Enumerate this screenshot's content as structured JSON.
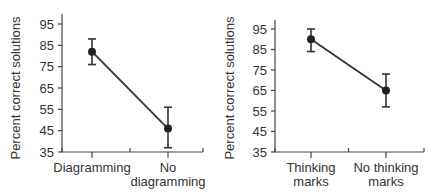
{
  "chart_data": [
    {
      "type": "line",
      "title": "",
      "xlabel": "",
      "ylabel": "Percent correct solutions",
      "ylim": [
        35,
        95
      ],
      "yticks": [
        35,
        45,
        55,
        65,
        75,
        85,
        95
      ],
      "categories": [
        "Diagramming",
        "No diagramming"
      ],
      "category_lines": [
        [
          "Diagramming"
        ],
        [
          "No",
          "diagramming"
        ]
      ],
      "series": [
        {
          "name": "Mean",
          "values": [
            82,
            46
          ],
          "error_low": [
            76,
            37
          ],
          "error_high": [
            88,
            56
          ]
        }
      ],
      "grid": false,
      "legend": null
    },
    {
      "type": "line",
      "title": "",
      "xlabel": "",
      "ylabel": "Percent correct solutions",
      "ylim": [
        35,
        95
      ],
      "yticks": [
        35,
        45,
        55,
        65,
        75,
        85,
        95
      ],
      "categories": [
        "Thinking marks",
        "No thinking marks"
      ],
      "category_lines": [
        [
          "Thinking",
          "marks"
        ],
        [
          "No thinking",
          "marks"
        ]
      ],
      "series": [
        {
          "name": "Mean",
          "values": [
            90,
            65
          ],
          "error_low": [
            84,
            57
          ],
          "error_high": [
            95,
            73
          ]
        }
      ],
      "grid": false,
      "legend": null
    }
  ]
}
